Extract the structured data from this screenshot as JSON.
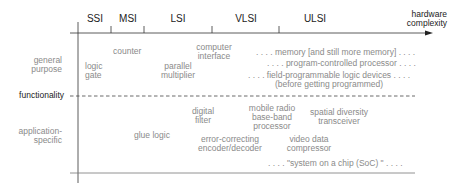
{
  "axes": {
    "x_label": [
      "hardware",
      "complexity"
    ],
    "y_label": "functionality",
    "rows": {
      "general": [
        "general",
        "purpose"
      ],
      "specific": [
        "application-",
        "specific"
      ]
    },
    "scale_levels": [
      "SSI",
      "MSI",
      "LSI",
      "VLSI",
      "ULSI"
    ]
  },
  "general_purpose_items": {
    "logic_gate": [
      "logic",
      "gate"
    ],
    "counter": "counter",
    "parallel_multiplier": [
      "parallel",
      "multiplier"
    ],
    "computer_interface": [
      "computer",
      "interface"
    ],
    "memory": ". . . . memory [and still more memory] . . . .",
    "processor": ". . . . program-controlled processor . . . .",
    "fpga_1": ". . . . field-programmable logic devices . . . .",
    "fpga_2": "(before getting programmed)"
  },
  "application_specific_items": {
    "glue_logic": "glue logic",
    "digital_filter": [
      "digital",
      "filter"
    ],
    "ecc": [
      "error-correcting",
      "encoder/decoder"
    ],
    "mobile_radio": [
      "mobile radio",
      "base-band",
      "processor"
    ],
    "video": [
      "video data",
      "compressor"
    ],
    "spatial": [
      "spatial diversity",
      "transceiver"
    ],
    "soc": ". . . . \"system on a chip (SoC) \" . . . ."
  },
  "colors": {
    "axis": "#333333",
    "item_text": "#8a8a8a",
    "axis_text": "#222222"
  }
}
